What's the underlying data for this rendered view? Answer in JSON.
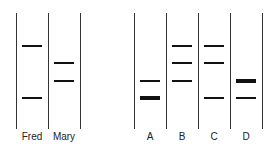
{
  "left_gel": {
    "lanes": [
      {
        "label": "Fred",
        "bands": [
          {
            "y": 46,
            "thick": 2
          },
          {
            "y": 98,
            "thick": 2
          }
        ]
      },
      {
        "label": "Mary",
        "bands": [
          {
            "y": 63,
            "thick": 1.5
          },
          {
            "y": 81,
            "thick": 1.5
          }
        ]
      }
    ]
  },
  "right_gel": {
    "lanes": [
      {
        "label": "A",
        "bands": [
          {
            "y": 81,
            "thick": 1.5
          },
          {
            "y": 98,
            "thick": 4
          }
        ]
      },
      {
        "label": "B",
        "bands": [
          {
            "y": 46,
            "thick": 1.5
          },
          {
            "y": 63,
            "thick": 1.5
          },
          {
            "y": 81,
            "thick": 1.5
          }
        ]
      },
      {
        "label": "C",
        "bands": [
          {
            "y": 46,
            "thick": 1.5
          },
          {
            "y": 63,
            "thick": 1.5
          },
          {
            "y": 98,
            "thick": 1.5
          }
        ]
      },
      {
        "label": "D",
        "bands": [
          {
            "y": 81,
            "thick": 4
          },
          {
            "y": 98,
            "thick": 1.5
          }
        ]
      }
    ]
  },
  "colors": {
    "line": "#333333",
    "band": "#111111"
  }
}
